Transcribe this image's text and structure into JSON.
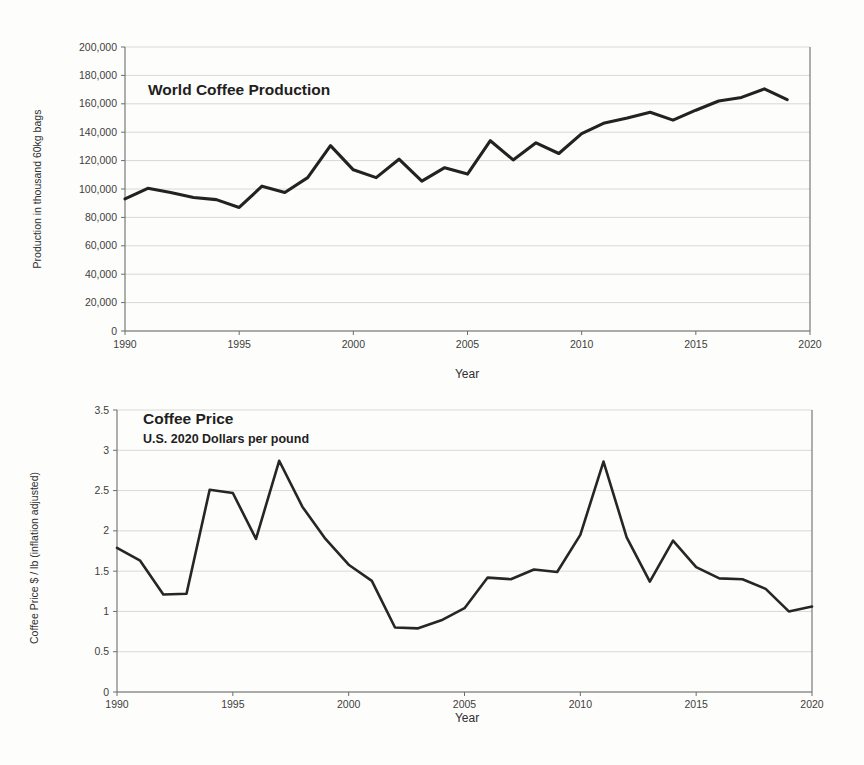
{
  "page": {
    "background_color": "#fdfdfb",
    "ink_color": "#222222",
    "grid_color": "#c9c9c9"
  },
  "chart_data": [
    {
      "id": "world-coffee-production",
      "type": "line",
      "title": "World Coffee Production",
      "subtitle": "",
      "xlabel": "Year",
      "ylabel": "Production in thousand 60kg bags",
      "xlim": [
        1990,
        2020
      ],
      "ylim": [
        0,
        200000
      ],
      "xticks": [
        1990,
        1995,
        2000,
        2005,
        2010,
        2015,
        2020
      ],
      "xtick_labels": [
        "1990",
        "1995",
        "2000",
        "2005",
        "2010",
        "2015",
        "2020"
      ],
      "yticks": [
        0,
        20000,
        40000,
        60000,
        80000,
        100000,
        120000,
        140000,
        160000,
        180000,
        200000
      ],
      "ytick_labels": [
        "0",
        "20,000",
        "40,000",
        "60,000",
        "80,000",
        "100,000",
        "120,000",
        "140,000",
        "160,000",
        "180,000",
        "200,000"
      ],
      "grid": true,
      "legend": false,
      "line_color": "#222222",
      "x": [
        1990,
        1991,
        1992,
        1993,
        1994,
        1995,
        1996,
        1997,
        1998,
        1999,
        2000,
        2001,
        2002,
        2003,
        2004,
        2005,
        2006,
        2007,
        2008,
        2009,
        2010,
        2011,
        2012,
        2013,
        2014,
        2015,
        2016,
        2017,
        2018,
        2019
      ],
      "values": [
        93000,
        100500,
        97500,
        94000,
        92500,
        87000,
        102000,
        97500,
        108000,
        130500,
        113500,
        108000,
        121000,
        105500,
        115000,
        110500,
        134000,
        120500,
        132500,
        125000,
        139000,
        146500,
        150000,
        154000,
        148500,
        155500,
        162000,
        164500,
        170500,
        163000
      ]
    },
    {
      "id": "coffee-price",
      "type": "line",
      "title": "Coffee Price",
      "subtitle": "U.S. 2020 Dollars per pound",
      "xlabel": "Year",
      "ylabel": "Coffee Price $ / lb (inflation adjusted)",
      "xlim": [
        1990,
        2020
      ],
      "ylim": [
        0,
        3.5
      ],
      "xticks": [
        1990,
        1995,
        2000,
        2005,
        2010,
        2015,
        2020
      ],
      "xtick_labels": [
        "1990",
        "1995",
        "2000",
        "2005",
        "2010",
        "2015",
        "2020"
      ],
      "yticks": [
        0,
        0.5,
        1,
        1.5,
        2,
        2.5,
        3,
        3.5
      ],
      "ytick_labels": [
        "0",
        "0.5",
        "1",
        "1.5",
        "2",
        "2.5",
        "3",
        "3.5"
      ],
      "grid": true,
      "legend": false,
      "line_color": "#262626",
      "x": [
        1990,
        1991,
        1992,
        1993,
        1994,
        1995,
        1996,
        1997,
        1998,
        1999,
        2000,
        2001,
        2002,
        2003,
        2004,
        2005,
        2006,
        2007,
        2008,
        2009,
        2010,
        2011,
        2012,
        2013,
        2014,
        2015,
        2016,
        2017,
        2018,
        2019,
        2020
      ],
      "values": [
        1.79,
        1.63,
        1.21,
        1.22,
        2.51,
        2.47,
        1.9,
        2.87,
        2.3,
        1.9,
        1.58,
        1.38,
        0.8,
        0.79,
        0.89,
        1.04,
        1.42,
        1.4,
        1.52,
        1.49,
        1.95,
        2.86,
        1.92,
        1.37,
        1.88,
        1.55,
        1.41,
        1.4,
        1.28,
        1.0,
        1.06
      ]
    }
  ]
}
